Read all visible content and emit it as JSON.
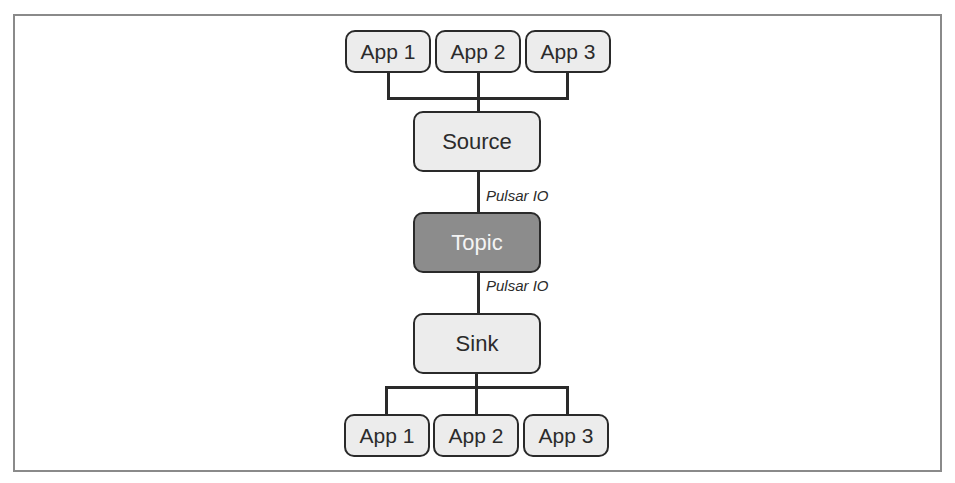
{
  "diagram": {
    "top_apps": [
      {
        "label": "App 1"
      },
      {
        "label": "App 2"
      },
      {
        "label": "App 3"
      }
    ],
    "source": {
      "label": "Source"
    },
    "topic": {
      "label": "Topic",
      "fill": "#8c8c8c"
    },
    "sink": {
      "label": "Sink"
    },
    "bottom_apps": [
      {
        "label": "App 1"
      },
      {
        "label": "App 2"
      },
      {
        "label": "App 3"
      }
    ],
    "edges": {
      "source_to_topic_label": "Pulsar IO",
      "topic_to_sink_label": "Pulsar IO"
    },
    "colors": {
      "node_fill": "#ececec",
      "topic_fill": "#8c8c8c",
      "stroke": "#2a2a2a",
      "frame": "#8a8a8a"
    }
  }
}
